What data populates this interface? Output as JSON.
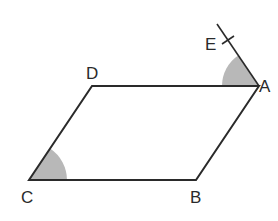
{
  "figure": {
    "type": "parallelogram",
    "colors": {
      "stroke": "#2a2a2a",
      "angle_fill": "#b8b8b8",
      "background": "#ffffff"
    },
    "points": {
      "A": {
        "label": "A",
        "x": 259,
        "y": 86
      },
      "B": {
        "label": "B",
        "x": 196,
        "y": 180
      },
      "C": {
        "label": "C",
        "x": 29,
        "y": 180
      },
      "D": {
        "label": "D",
        "x": 92,
        "y": 86
      },
      "E": {
        "label": "E",
        "x": 228,
        "y": 40
      }
    },
    "segments": [
      "AB",
      "BC",
      "CD",
      "DA",
      "AE"
    ],
    "shaded_angles": [
      "DAE",
      "BCD"
    ],
    "tick_mark_on": "E"
  }
}
